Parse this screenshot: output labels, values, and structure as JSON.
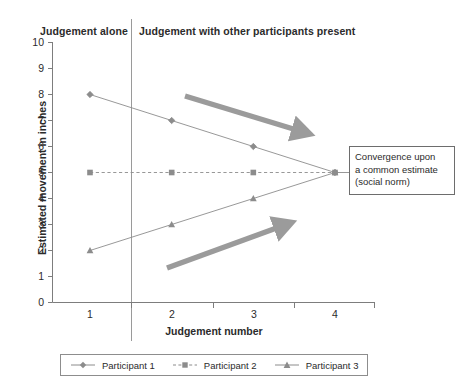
{
  "headers": {
    "left": "Judgement alone",
    "right": "Judgement with other participants present"
  },
  "annotation": {
    "text": "Convergence upon a common estimate (social norm)",
    "line1": "Convergence upon",
    "line2": "a common estimate",
    "line3": "(social norm)"
  },
  "legend": {
    "items": [
      {
        "label": "Participant 1",
        "marker": "diamond-marker",
        "line": "solid",
        "color": "#8c8c8c"
      },
      {
        "label": "Participant 2",
        "marker": "square-marker",
        "line": "dashed",
        "color": "#8c8c8c"
      },
      {
        "label": "Participant 3",
        "marker": "triangle-marker",
        "line": "solid",
        "color": "#8c8c8c"
      }
    ]
  },
  "colors": {
    "series": "#8c8c8c",
    "arrow": "#9b9b9b",
    "axis": "#7d7d7d",
    "divider": "#9a9a9a",
    "text": "#2b2b2b"
  },
  "chart_data": {
    "type": "line",
    "title": "",
    "xlabel": "Judgement number",
    "ylabel": "Estimated movement in inches",
    "categories": [
      "1",
      "2",
      "3",
      "4"
    ],
    "x": [
      1,
      2,
      3,
      4
    ],
    "xlim": [
      1,
      4
    ],
    "ylim": [
      0,
      10
    ],
    "yticks": [
      0,
      1,
      2,
      3,
      4,
      5,
      6,
      7,
      8,
      9,
      10
    ],
    "grid": false,
    "legend_position": "bottom",
    "series": [
      {
        "name": "Participant 1",
        "values": [
          8,
          7,
          6,
          5
        ],
        "marker": "diamond",
        "linestyle": "solid"
      },
      {
        "name": "Participant 2",
        "values": [
          5,
          5,
          5,
          5
        ],
        "marker": "square",
        "linestyle": "dashed"
      },
      {
        "name": "Participant 3",
        "values": [
          2,
          3,
          4,
          5
        ],
        "marker": "triangle",
        "linestyle": "solid"
      }
    ],
    "annotations": [
      {
        "text": "Judgement alone",
        "type": "region-label",
        "x_range": [
          1,
          1.5
        ]
      },
      {
        "text": "Judgement with other participants present",
        "type": "region-label",
        "x_range": [
          1.5,
          4
        ]
      },
      {
        "text": "Convergence upon a common estimate (social norm)",
        "type": "callout",
        "points_to": [
          4,
          5
        ]
      },
      {
        "text": "",
        "type": "arrow-down-right",
        "from": [
          1.9,
          8.3
        ],
        "to": [
          3.2,
          6.3
        ]
      },
      {
        "text": "",
        "type": "arrow-up-right",
        "from": [
          1.9,
          1.65
        ],
        "to": [
          3.2,
          3.7
        ]
      }
    ]
  }
}
